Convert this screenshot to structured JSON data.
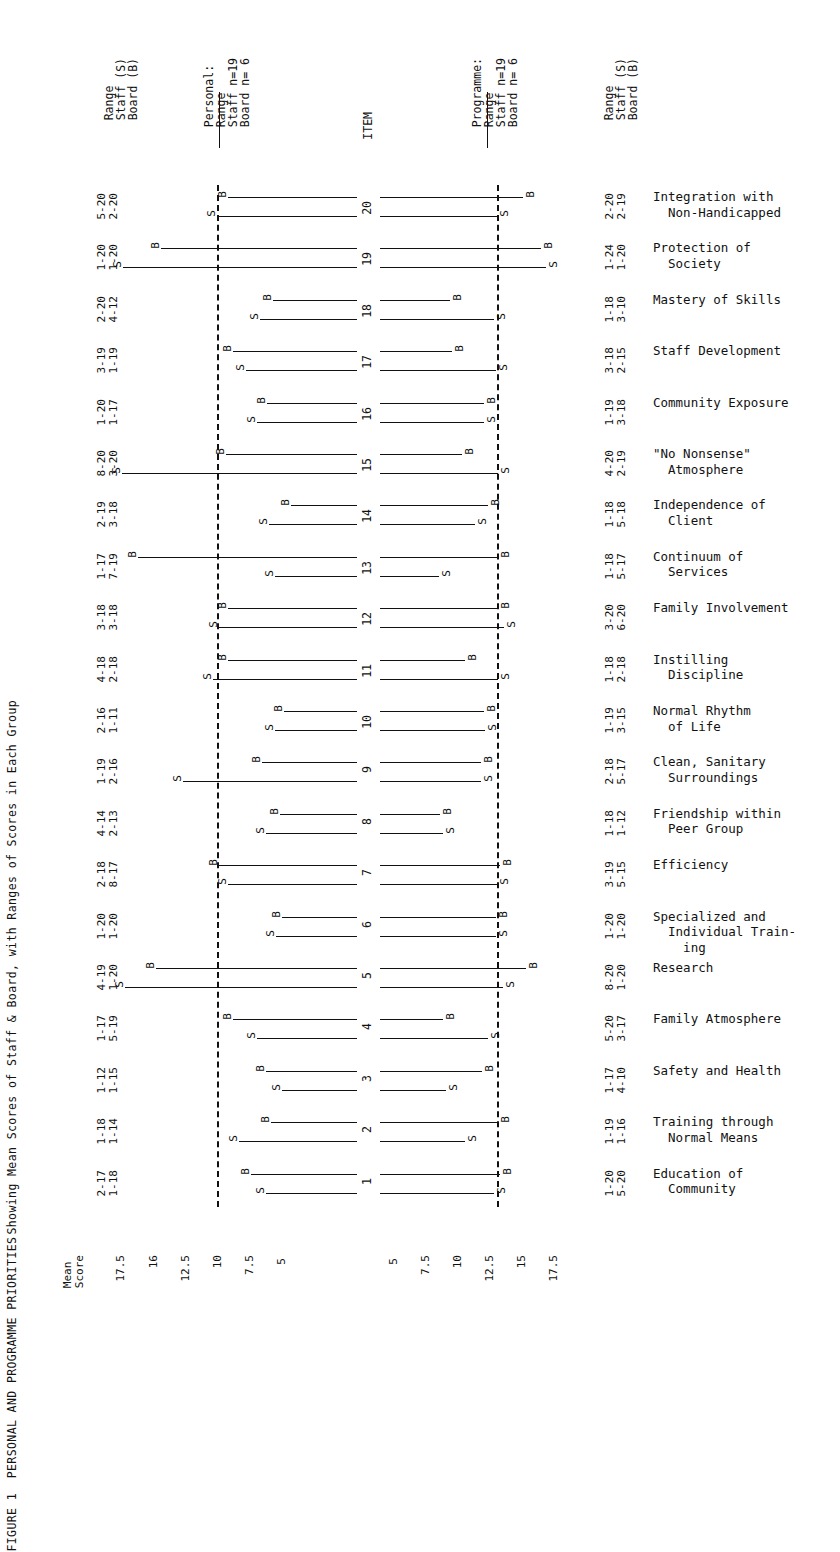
{
  "figure": {
    "caption_line1": "FIGURE 1  PERSONAL AND PROGRAMME PRIORITIES",
    "caption_line2": "Showing Mean Scores of Staff & Board, with Ranges of Scores in Each Group"
  },
  "headers": {
    "left_range": "Range\nStaff (S)\nBoard (B)",
    "personal": "Personal:\nRange\nStaff n=19\nBoard n= 6",
    "item": "ITEM",
    "programme": "Programme:\nRange\nStaff n=19\nBoard n= 6",
    "right_range": "Range\nStaff (S)\nBoard (B)"
  },
  "axis": {
    "mean_score_label": "Mean\nScore",
    "left_ticks": [
      "17.5",
      "16",
      "12.5",
      "10",
      "7.5",
      "5"
    ],
    "right_ticks": [
      "5",
      "7.5",
      "10",
      "12.5",
      "15",
      "17.5"
    ]
  },
  "chart_data": {
    "type": "bar",
    "title": "FIGURE 1  PERSONAL AND PROGRAMME PRIORITIES",
    "subtitle": "Showing Mean Scores of Staff & Board, with Ranges of Scores in Each Group",
    "xlabel": "Mean Score",
    "ylabel": "ITEM",
    "legend": [
      "S = Staff",
      "B = Board"
    ],
    "note": "Mirrored horizontal range/mean chart. Personal priorities on the left panel (scale decreasing outward 17.5 to 5), Programme priorities on the right panel (scale increasing outward 5 to 17.5). Dashed vertical reference lines at mean score 12.5 on both panels.",
    "reference_line_value": 12.5,
    "rows": [
      {
        "item": "20",
        "label_line1": "Integration with",
        "label_line2": "Non-Handicapped",
        "personal_range_staff": "5-20",
        "personal_range_board": "2-20",
        "programme_range_staff": "2-20",
        "programme_range_board": "2-19",
        "personal_mean_board": 11.9,
        "personal_mean_staff": 12.5,
        "programme_mean_board": 14.3,
        "programme_mean_staff": 12.5
      },
      {
        "item": "19",
        "label_line1": "Protection of",
        "label_line2": "Society",
        "personal_range_staff": "1-20",
        "personal_range_board": "1-20",
        "programme_range_staff": "1-24",
        "programme_range_board": "1-20",
        "personal_mean_board": 15.6,
        "personal_mean_staff": 17.7,
        "programme_mean_board": 15.5,
        "programme_mean_staff": 15.9
      },
      {
        "item": "18",
        "label_line1": "Mastery of Skills",
        "label_line2": "",
        "personal_range_staff": "2-20",
        "personal_range_board": "4-12",
        "programme_range_staff": "1-18",
        "programme_range_board": "3-10",
        "personal_mean_board": 9.4,
        "personal_mean_staff": 10.1,
        "programme_mean_board": 9.3,
        "programme_mean_staff": 12.3
      },
      {
        "item": "17",
        "label_line1": "Staff Development",
        "label_line2": "",
        "personal_range_staff": "3-19",
        "personal_range_board": "1-19",
        "programme_range_staff": "3-18",
        "programme_range_board": "2-15",
        "personal_mean_board": 11.6,
        "personal_mean_staff": 10.9,
        "programme_mean_board": 9.4,
        "programme_mean_staff": 12.4
      },
      {
        "item": "16",
        "label_line1": "Community Exposure",
        "label_line2": "",
        "personal_range_staff": "1-20",
        "personal_range_board": "1-17",
        "programme_range_staff": "1-19",
        "programme_range_board": "3-18",
        "personal_mean_board": 9.7,
        "personal_mean_staff": 10.3,
        "programme_mean_board": 11.6,
        "programme_mean_staff": 11.6
      },
      {
        "item": "15",
        "label_line1": "\"No Nonsense\"",
        "label_line2": "Atmosphere",
        "personal_range_staff": "8-20",
        "personal_range_board": "3-20",
        "programme_range_staff": "4-20",
        "programme_range_board": "2-19",
        "personal_mean_board": 12.0,
        "personal_mean_staff": 17.8,
        "programme_mean_board": 10.1,
        "programme_mean_staff": 12.6
      },
      {
        "item": "14",
        "label_line1": "Independence of",
        "label_line2": "Client",
        "personal_range_staff": "2-19",
        "personal_range_board": "3-18",
        "programme_range_staff": "1-18",
        "programme_range_board": "5-18",
        "personal_mean_board": 8.4,
        "personal_mean_staff": 9.6,
        "programme_mean_board": 11.9,
        "programme_mean_staff": 11.0
      },
      {
        "item": "13",
        "label_line1": "Continuum of",
        "label_line2": "Services",
        "personal_range_staff": "1-17",
        "personal_range_board": "7-19",
        "programme_range_staff": "1-18",
        "programme_range_board": "5-17",
        "personal_mean_board": 16.9,
        "personal_mean_staff": 9.3,
        "programme_mean_board": 12.6,
        "programme_mean_staff": 8.5
      },
      {
        "item": "12",
        "label_line1": "Family Involvement",
        "label_line2": "",
        "personal_range_staff": "3-18",
        "personal_range_board": "3-18",
        "programme_range_staff": "3-20",
        "programme_range_board": "6-20",
        "personal_mean_board": 11.9,
        "personal_mean_staff": 12.4,
        "programme_mean_board": 12.6,
        "programme_mean_staff": 13.0
      },
      {
        "item": "11",
        "label_line1": "Instilling",
        "label_line2": "Discipline",
        "personal_range_staff": "4-18",
        "personal_range_board": "2-18",
        "programme_range_staff": "1-18",
        "programme_range_board": "2-18",
        "personal_mean_board": 11.9,
        "personal_mean_staff": 12.7,
        "programme_mean_board": 10.3,
        "programme_mean_staff": 12.6
      },
      {
        "item": "10",
        "label_line1": "Normal Rhythm",
        "label_line2": "of Life",
        "personal_range_staff": "2-16",
        "personal_range_board": "1-11",
        "programme_range_staff": "1-19",
        "programme_range_board": "3-15",
        "personal_mean_board": 8.8,
        "personal_mean_staff": 9.3,
        "programme_mean_board": 11.6,
        "programme_mean_staff": 11.7
      },
      {
        "item": "9",
        "label_line1": "Clean, Sanitary",
        "label_line2": "Surroundings",
        "personal_range_staff": "1-19",
        "personal_range_board": "2-16",
        "programme_range_staff": "2-18",
        "programme_range_board": "5-17",
        "personal_mean_board": 10.0,
        "personal_mean_staff": 14.4,
        "programme_mean_board": 11.4,
        "programme_mean_staff": 11.4
      },
      {
        "item": "8",
        "label_line1": "Friendship within",
        "label_line2": "Peer Group",
        "personal_range_staff": "4-14",
        "personal_range_board": "2-13",
        "programme_range_staff": "1-18",
        "programme_range_board": "1-12",
        "personal_mean_board": 9.0,
        "personal_mean_staff": 9.8,
        "programme_mean_board": 8.6,
        "programme_mean_staff": 8.8
      },
      {
        "item": "7",
        "label_line1": "Efficiency",
        "label_line2": "",
        "personal_range_staff": "2-18",
        "personal_range_board": "8-17",
        "programme_range_staff": "3-19",
        "programme_range_board": "5-15",
        "personal_mean_board": 12.4,
        "personal_mean_staff": 11.9,
        "programme_mean_board": 12.7,
        "programme_mean_staff": 12.5
      },
      {
        "item": "6",
        "label_line1": "Specialized and",
        "label_line2": "Individual Train-\n    ing",
        "personal_range_staff": "1-20",
        "personal_range_board": "1-20",
        "programme_range_staff": "1-20",
        "programme_range_board": "1-20",
        "personal_mean_board": 8.9,
        "personal_mean_staff": 9.2,
        "programme_mean_board": 12.4,
        "programme_mean_staff": 12.4
      },
      {
        "item": "5",
        "label_line1": "Research",
        "label_line2": "",
        "personal_range_staff": "4-19",
        "personal_range_board": "1-20",
        "programme_range_staff": "8-20",
        "programme_range_board": "1-20",
        "personal_mean_board": 15.9,
        "personal_mean_staff": 17.6,
        "programme_mean_board": 14.5,
        "programme_mean_staff": 12.9
      },
      {
        "item": "4",
        "label_line1": "Family Atmosphere",
        "label_line2": "",
        "personal_range_staff": "1-17",
        "personal_range_board": "5-19",
        "programme_range_staff": "5-20",
        "programme_range_board": "3-17",
        "personal_mean_board": 11.6,
        "personal_mean_staff": 10.3,
        "programme_mean_board": 8.8,
        "programme_mean_staff": 11.9
      },
      {
        "item": "3",
        "label_line1": "Safety and Health",
        "label_line2": "",
        "personal_range_staff": "1-12",
        "personal_range_board": "1-15",
        "programme_range_staff": "1-17",
        "programme_range_board": "4-10",
        "personal_mean_board": 9.8,
        "personal_mean_staff": 8.9,
        "programme_mean_board": 11.5,
        "programme_mean_staff": 9.0
      },
      {
        "item": "2",
        "label_line1": "Training through",
        "label_line2": "Normal Means",
        "personal_range_staff": "1-18",
        "personal_range_board": "1-14",
        "programme_range_staff": "1-19",
        "programme_range_board": "1-16",
        "personal_mean_board": 9.5,
        "personal_mean_staff": 11.3,
        "programme_mean_board": 12.6,
        "programme_mean_staff": 10.3
      },
      {
        "item": "1",
        "label_line1": "Education of",
        "label_line2": "Community",
        "personal_range_staff": "2-17",
        "personal_range_board": "1-18",
        "programme_range_staff": "1-20",
        "programme_range_board": "5-20",
        "personal_mean_board": 10.6,
        "personal_mean_staff": 9.8,
        "programme_mean_board": 12.7,
        "programme_mean_staff": 12.3
      }
    ]
  }
}
